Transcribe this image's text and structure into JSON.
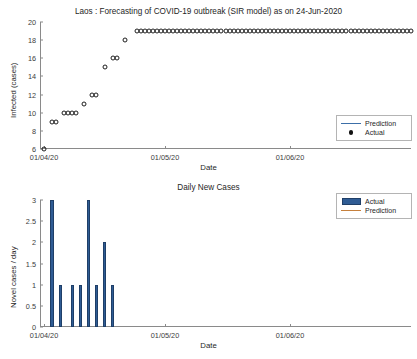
{
  "figure": {
    "width": 417,
    "height": 359,
    "background": "#ffffff"
  },
  "colors": {
    "prediction_line_top": "#3c6fa8",
    "prediction_line_bottom": "#c6803c",
    "actual_marker": "#111111",
    "bar_fill": "#2f5c94",
    "bar_edge": "#1f3f68",
    "axis": "#8a8a8a",
    "text": "#262626"
  },
  "chart_data": [
    {
      "id": "infected-chart",
      "type": "scatter",
      "title": "Laos : Forecasting of COVID-19 outbreak (SIR model) as on 24-Jun-2020",
      "xlabel": "Date",
      "ylabel": "Infected (cases)",
      "ylim": [
        6,
        20
      ],
      "yticks": [
        6,
        8,
        10,
        12,
        14,
        16,
        18,
        20
      ],
      "ytick_labels": [
        "6",
        "8",
        "10",
        "12",
        "14",
        "16",
        "18",
        "20"
      ],
      "xlim_labels": [
        "01/04/20",
        "01/05/20",
        "01/06/20"
      ],
      "xticks_day_index": [
        1,
        31,
        62
      ],
      "xtick_labels": [
        "01/04/20",
        "01/05/20",
        "01/06/20"
      ],
      "x_day_range": [
        0,
        92
      ],
      "grid": false,
      "legend_position": "lower-right",
      "legend": [
        {
          "label": "Prediction",
          "marker": "line",
          "color": "#3c6fa8"
        },
        {
          "label": "Actual",
          "marker": "dot",
          "color": "#111111"
        }
      ],
      "series": [
        {
          "name": "Actual",
          "marker": "open-circle",
          "points": [
            {
              "day": 1,
              "value": 6
            },
            {
              "day": 3,
              "value": 9
            },
            {
              "day": 4,
              "value": 9
            },
            {
              "day": 6,
              "value": 10
            },
            {
              "day": 7,
              "value": 10
            },
            {
              "day": 8,
              "value": 10
            },
            {
              "day": 9,
              "value": 10
            },
            {
              "day": 11,
              "value": 11
            },
            {
              "day": 13,
              "value": 12
            },
            {
              "day": 14,
              "value": 12
            },
            {
              "day": 16,
              "value": 15
            },
            {
              "day": 18,
              "value": 16
            },
            {
              "day": 19,
              "value": 16
            },
            {
              "day": 21,
              "value": 18
            },
            {
              "day": 24,
              "value": 19
            },
            {
              "day": 25,
              "value": 19
            },
            {
              "day": 26,
              "value": 19
            },
            {
              "day": 27,
              "value": 19
            },
            {
              "day": 28,
              "value": 19
            },
            {
              "day": 29,
              "value": 19
            },
            {
              "day": 30,
              "value": 19
            },
            {
              "day": 31,
              "value": 19
            },
            {
              "day": 32,
              "value": 19
            },
            {
              "day": 33,
              "value": 19
            },
            {
              "day": 34,
              "value": 19
            },
            {
              "day": 35,
              "value": 19
            },
            {
              "day": 36,
              "value": 19
            },
            {
              "day": 37,
              "value": 19
            },
            {
              "day": 38,
              "value": 19
            },
            {
              "day": 39,
              "value": 19
            },
            {
              "day": 40,
              "value": 19
            },
            {
              "day": 41,
              "value": 19
            },
            {
              "day": 42,
              "value": 19
            },
            {
              "day": 43,
              "value": 19
            },
            {
              "day": 44,
              "value": 19
            },
            {
              "day": 45,
              "value": 19
            },
            {
              "day": 46,
              "value": 19
            },
            {
              "day": 47,
              "value": 19
            },
            {
              "day": 48,
              "value": 19
            },
            {
              "day": 49,
              "value": 19
            },
            {
              "day": 50,
              "value": 19
            },
            {
              "day": 51,
              "value": 19
            },
            {
              "day": 52,
              "value": 19
            },
            {
              "day": 53,
              "value": 19
            },
            {
              "day": 54,
              "value": 19
            },
            {
              "day": 55,
              "value": 19
            },
            {
              "day": 56,
              "value": 19
            },
            {
              "day": 57,
              "value": 19
            },
            {
              "day": 58,
              "value": 19
            },
            {
              "day": 59,
              "value": 19
            },
            {
              "day": 60,
              "value": 19
            },
            {
              "day": 61,
              "value": 19
            },
            {
              "day": 62,
              "value": 19
            },
            {
              "day": 63,
              "value": 19
            },
            {
              "day": 64,
              "value": 19
            },
            {
              "day": 65,
              "value": 19
            },
            {
              "day": 66,
              "value": 19
            },
            {
              "day": 67,
              "value": 19
            },
            {
              "day": 68,
              "value": 19
            },
            {
              "day": 69,
              "value": 19
            },
            {
              "day": 70,
              "value": 19
            },
            {
              "day": 71,
              "value": 19
            },
            {
              "day": 72,
              "value": 19
            },
            {
              "day": 73,
              "value": 19
            },
            {
              "day": 74,
              "value": 19
            },
            {
              "day": 75,
              "value": 19
            },
            {
              "day": 76,
              "value": 19
            },
            {
              "day": 77,
              "value": 19
            },
            {
              "day": 78,
              "value": 19
            },
            {
              "day": 79,
              "value": 19
            },
            {
              "day": 80,
              "value": 19
            },
            {
              "day": 81,
              "value": 19
            },
            {
              "day": 82,
              "value": 19
            },
            {
              "day": 83,
              "value": 19
            },
            {
              "day": 84,
              "value": 19
            },
            {
              "day": 85,
              "value": 19
            },
            {
              "day": 86,
              "value": 19
            },
            {
              "day": 87,
              "value": 19
            },
            {
              "day": 88,
              "value": 19
            },
            {
              "day": 89,
              "value": 19
            },
            {
              "day": 90,
              "value": 19
            },
            {
              "day": 91,
              "value": 19
            },
            {
              "day": 92,
              "value": 19
            }
          ]
        }
      ]
    },
    {
      "id": "daily-new-cases-chart",
      "type": "bar",
      "title": "Daily New Cases",
      "xlabel": "Date",
      "ylabel": "Novel cases / day",
      "ylim": [
        0,
        3
      ],
      "yticks": [
        0,
        0.5,
        1,
        1.5,
        2,
        2.5,
        3
      ],
      "ytick_labels": [
        "0",
        "0.5",
        "1",
        "1.5",
        "2",
        "2.5",
        "3"
      ],
      "xticks_day_index": [
        1,
        31,
        62
      ],
      "xtick_labels": [
        "01/04/20",
        "01/05/20",
        "01/06/20"
      ],
      "x_day_range": [
        0,
        92
      ],
      "grid": false,
      "legend_position": "upper-right",
      "legend": [
        {
          "label": "Actual",
          "marker": "patch",
          "color": "#2f5c94"
        },
        {
          "label": "Prediction",
          "marker": "line",
          "color": "#c6803c"
        }
      ],
      "series": [
        {
          "name": "Actual",
          "bars": [
            {
              "day": 3,
              "value": 3
            },
            {
              "day": 5,
              "value": 1
            },
            {
              "day": 8,
              "value": 1
            },
            {
              "day": 10,
              "value": 1
            },
            {
              "day": 12,
              "value": 3
            },
            {
              "day": 14,
              "value": 1
            },
            {
              "day": 16,
              "value": 2
            },
            {
              "day": 18,
              "value": 1
            }
          ]
        }
      ]
    }
  ]
}
